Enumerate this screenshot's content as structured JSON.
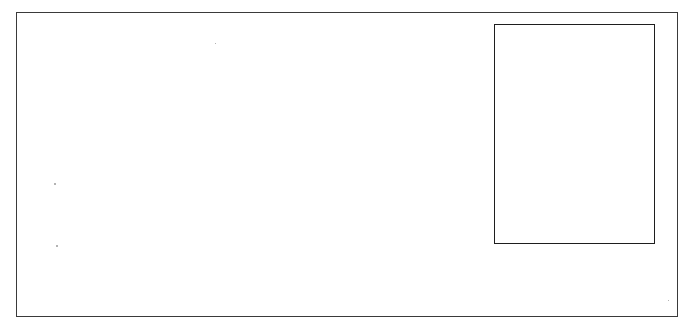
{
  "page": {
    "background": "#ffffff",
    "border_color": "#3a3a3a"
  },
  "frame": {
    "label": ""
  },
  "inner_box": {
    "label": "",
    "border_color": "#1e1e1e"
  }
}
